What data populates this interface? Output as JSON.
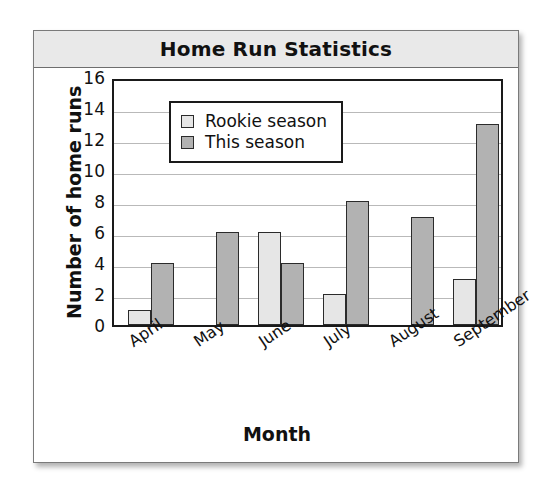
{
  "card": {
    "title": "Home Run Statistics"
  },
  "chart_data": {
    "type": "bar",
    "title": "Home Run Statistics",
    "xlabel": "Month",
    "ylabel": "Number of home runs",
    "categories": [
      "April",
      "May",
      "June",
      "July",
      "August",
      "September"
    ],
    "series": [
      {
        "name": "Rookie season",
        "values": [
          1,
          0,
          6,
          2,
          0,
          3
        ],
        "color": "#e6e6e6"
      },
      {
        "name": "This season",
        "values": [
          4,
          6,
          4,
          8,
          7,
          13
        ],
        "color": "#b2b2b2"
      }
    ],
    "ylim": [
      0,
      16
    ],
    "ytick_labels": [
      "16",
      "14",
      "12",
      "10",
      "8",
      "6",
      "4",
      "2",
      "0"
    ],
    "ytick_values": [
      16,
      14,
      12,
      10,
      8,
      6,
      4,
      2,
      0
    ],
    "grid": "horizontal",
    "legend_position": "top-left-inside"
  }
}
